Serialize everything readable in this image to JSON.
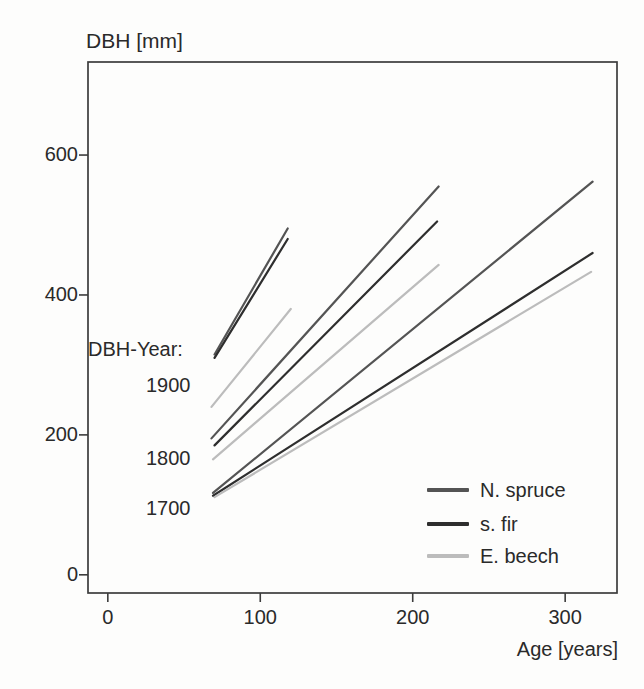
{
  "figure": {
    "title": "DBH [mm]",
    "x_axis_label": "Age [years]"
  },
  "annotation": {
    "header": "DBH-Year:",
    "years": [
      "1900",
      "1800",
      "1700"
    ]
  },
  "legend": {
    "items": [
      {
        "label": "N. spruce",
        "color": "#545454"
      },
      {
        "label": "s. fir",
        "color": "#2e2e2e"
      },
      {
        "label": "E. beech",
        "color": "#bcbcbc"
      }
    ]
  },
  "axes": {
    "x": {
      "tick_labels": [
        "0",
        "100",
        "200",
        "300"
      ],
      "tick_values": [
        0,
        100,
        200,
        300
      ]
    },
    "y": {
      "tick_labels": [
        "0",
        "200",
        "400",
        "600"
      ],
      "tick_values": [
        0,
        200,
        400,
        600
      ]
    }
  },
  "colors": {
    "axis": "#3c3c3c",
    "text": "#2a2a2a"
  },
  "chart_data": {
    "type": "line",
    "title": "DBH [mm]",
    "xlabel": "Age [years]",
    "ylabel": "DBH [mm]",
    "xlim": [
      -13,
      334
    ],
    "ylim": [
      -26,
      733
    ],
    "grid": false,
    "legend_position": "lower right",
    "series": [
      {
        "name": "N. spruce",
        "dbh_year": 1900,
        "color": "#545454",
        "x": [
          70,
          118
        ],
        "y": [
          315,
          495
        ]
      },
      {
        "name": "s. fir",
        "dbh_year": 1900,
        "color": "#2e2e2e",
        "x": [
          70,
          118
        ],
        "y": [
          310,
          480
        ]
      },
      {
        "name": "E. beech",
        "dbh_year": 1900,
        "color": "#bcbcbc",
        "x": [
          68,
          120
        ],
        "y": [
          240,
          380
        ]
      },
      {
        "name": "N. spruce",
        "dbh_year": 1800,
        "color": "#545454",
        "x": [
          68,
          217
        ],
        "y": [
          195,
          555
        ]
      },
      {
        "name": "s. fir",
        "dbh_year": 1800,
        "color": "#2e2e2e",
        "x": [
          70,
          216
        ],
        "y": [
          185,
          505
        ]
      },
      {
        "name": "E. beech",
        "dbh_year": 1800,
        "color": "#bcbcbc",
        "x": [
          69,
          217
        ],
        "y": [
          165,
          443
        ]
      },
      {
        "name": "N. spruce",
        "dbh_year": 1700,
        "color": "#545454",
        "x": [
          69,
          318
        ],
        "y": [
          117,
          562
        ]
      },
      {
        "name": "s. fir",
        "dbh_year": 1700,
        "color": "#2e2e2e",
        "x": [
          69,
          318
        ],
        "y": [
          113,
          460
        ]
      },
      {
        "name": "E. beech",
        "dbh_year": 1700,
        "color": "#bcbcbc",
        "x": [
          70,
          317
        ],
        "y": [
          111,
          433
        ]
      }
    ]
  }
}
